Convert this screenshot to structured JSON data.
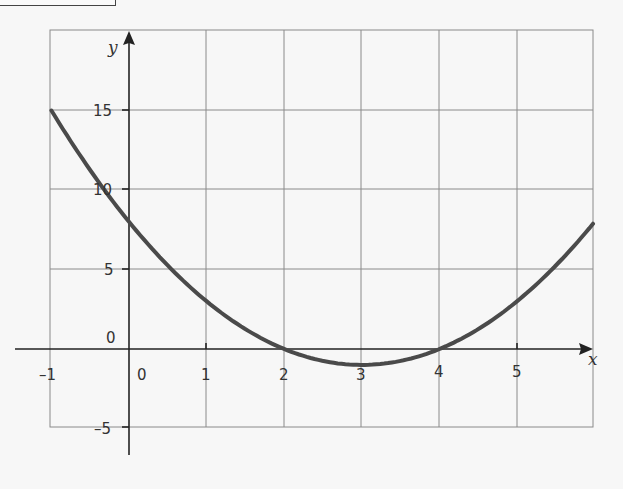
{
  "chart_data": {
    "type": "line",
    "title": "",
    "xlabel": "x",
    "ylabel": "y",
    "function": "y = x^2 - 6x + 8",
    "xlim": [
      -1,
      6
    ],
    "ylim": [
      -5,
      20
    ],
    "grid": true,
    "x_ticks": [
      "-1",
      "0",
      "1",
      "2",
      "3",
      "4",
      "5"
    ],
    "y_ticks": [
      "15",
      "10",
      "5",
      "0",
      "-5"
    ],
    "series": [
      {
        "name": "curve",
        "x": [
          -1,
          0,
          1,
          2,
          3,
          4,
          5,
          6
        ],
        "y": [
          15,
          8,
          3,
          0,
          -1,
          0,
          3,
          8
        ]
      }
    ],
    "color": "#4a4a4a"
  },
  "labels": {
    "x_axis": "x",
    "y_axis": "y",
    "origin_x": "0",
    "origin_y": "0",
    "xt": [
      "–1",
      "1",
      "2",
      "3",
      "4",
      "5"
    ],
    "yt": [
      "15",
      "10",
      "5",
      "–5"
    ]
  }
}
